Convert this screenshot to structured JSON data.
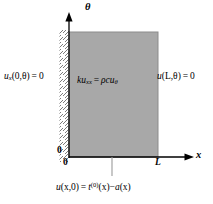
{
  "figure": {
    "name": "heat-equation-domain-diagram",
    "colors": {
      "region_fill": "#a8a8a8",
      "region_stroke": "#8c8c8c",
      "axis": "#000000",
      "hatch": "#6e6e6e",
      "background": "#ffffff"
    }
  },
  "axes": {
    "vertical": {
      "label": "θ",
      "origin_tick_label": "0"
    },
    "horizontal": {
      "label": "x",
      "origin_tick_label": "0",
      "end_tick_label": "L"
    }
  },
  "region": {
    "x_from": 0,
    "x_to": "L",
    "theta_from": 0,
    "theta_to": "open"
  },
  "equations": {
    "pde": {
      "lhs_coef": "k",
      "lhs_var": "u",
      "lhs_sub": "xx",
      "relation": "=",
      "rhs_coef": "ρc",
      "rhs_var": "u",
      "rhs_sub": "θ",
      "plain": "ku_xx = ρcu_θ"
    },
    "bc_left": {
      "var": "u",
      "sub": "x",
      "args": "(0,θ)",
      "relation": "=",
      "value": "0",
      "plain": "u_x(0,θ) = 0"
    },
    "bc_right": {
      "var": "u",
      "args": "(L,θ)",
      "relation": "=",
      "value": "0",
      "plain": "u(L,θ) = 0"
    },
    "initial_condition": {
      "lhs_var": "u",
      "lhs_args": "(x,0)",
      "relation": "=",
      "rhs_var": "t",
      "rhs_sup": "(0)",
      "rhs_args": "(x)",
      "minus": "−",
      "rhs2_var": "a",
      "rhs2_args": "(x)",
      "plain": "u(x,0) = t^(0)(x) − a(x)"
    }
  }
}
